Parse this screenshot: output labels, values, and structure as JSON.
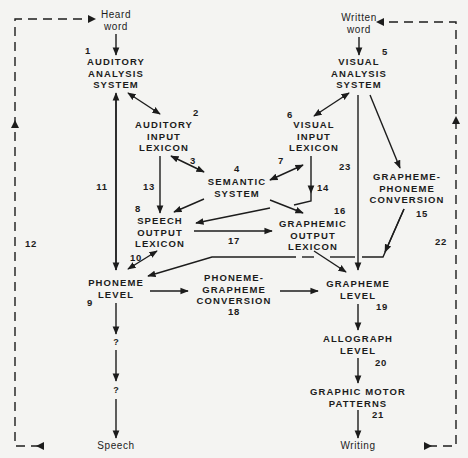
{
  "diagram": {
    "inputs": {
      "heard_word": [
        "Heard",
        "word"
      ],
      "written_word": [
        "Written",
        "word"
      ]
    },
    "outputs": {
      "speech": "Speech",
      "writing": "Writing"
    },
    "nodes": {
      "auditory_analysis": [
        "AUDITORY",
        "ANALYSIS",
        "SYSTEM"
      ],
      "auditory_input_lexicon": [
        "AUDITORY",
        "INPUT",
        "LEXICON"
      ],
      "semantic_system": [
        "SEMANTIC",
        "SYSTEM"
      ],
      "speech_output_lexicon": [
        "SPEECH",
        "OUTPUT",
        "LEXICON"
      ],
      "phoneme_level": [
        "PHONEME",
        "LEVEL"
      ],
      "phoneme_grapheme_conversion": [
        "PHONEME-",
        "GRAPHEME",
        "CONVERSION"
      ],
      "visual_analysis": [
        "VISUAL",
        "ANALYSIS",
        "SYSTEM"
      ],
      "visual_input_lexicon": [
        "VISUAL",
        "INPUT",
        "LEXICON"
      ],
      "grapheme_phoneme_conversion": [
        "GRAPHEME-",
        "PHONEME",
        "CONVERSION"
      ],
      "graphemic_output_lexicon": [
        "GRAPHEMIC",
        "OUTPUT",
        "LEXICON"
      ],
      "grapheme_level": [
        "GRAPHEME",
        "LEVEL"
      ],
      "allograph_level": [
        "ALLOGRAPH",
        "LEVEL"
      ],
      "graphic_motor_patterns": [
        "GRAPHIC MOTOR",
        "PATTERNS"
      ],
      "unknown_1": "?",
      "unknown_2": "?"
    },
    "numbers": {
      "n1": "1",
      "n2": "2",
      "n3": "3",
      "n4": "4",
      "n5": "5",
      "n6": "6",
      "n7": "7",
      "n8": "8",
      "n9": "9",
      "n10": "10",
      "n11": "11",
      "n12": "12",
      "n13": "13",
      "n14": "14",
      "n15": "15",
      "n16": "16",
      "n17": "17",
      "n18": "18",
      "n19": "19",
      "n20": "20",
      "n21": "21",
      "n22": "22",
      "n23": "23"
    },
    "colors": {
      "ink": "#1c1c1c",
      "paper": "#f4f4f2"
    }
  }
}
